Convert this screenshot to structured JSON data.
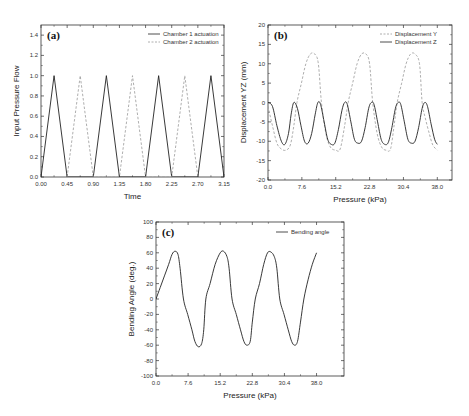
{
  "chart_data": [
    {
      "id": "a",
      "type": "line",
      "panel_label": "(a)",
      "title": "",
      "xlabel": "Time",
      "ylabel": "Input Pressure Flow",
      "xlim": [
        0,
        3.15
      ],
      "ylim": [
        0,
        1.5
      ],
      "xticks": [
        "0.00",
        "0.45",
        "0.90",
        "1.35",
        "1.80",
        "2.25",
        "2.70",
        "3.15"
      ],
      "yticks": [
        "0.0",
        "0.2",
        "0.4",
        "0.6",
        "0.8",
        "1.0",
        "1.2",
        "1.4"
      ],
      "grid": false,
      "legend_position": "top-right",
      "series": [
        {
          "name": "Chamber 1 actuation",
          "style": "solid",
          "x": [
            0.0,
            0.225,
            0.45,
            0.9,
            1.125,
            1.35,
            1.8,
            2.025,
            2.25,
            2.7,
            2.925,
            3.15
          ],
          "y": [
            0.0,
            1.0,
            0.0,
            0.0,
            1.0,
            0.0,
            0.0,
            1.0,
            0.0,
            0.0,
            1.0,
            0.0
          ]
        },
        {
          "name": "Chamber 2 actuation",
          "style": "dashed",
          "x": [
            0.45,
            0.675,
            0.9,
            1.35,
            1.575,
            1.8,
            2.25,
            2.475,
            2.7
          ],
          "y": [
            0.0,
            1.0,
            0.0,
            0.0,
            1.0,
            0.0,
            0.0,
            1.0,
            0.0
          ]
        }
      ]
    },
    {
      "id": "b",
      "type": "line",
      "panel_label": "(b)",
      "title": "",
      "xlabel": "Pressure (kPa)",
      "ylabel": "Displacement YZ (mm)",
      "xlim": [
        0,
        41.3
      ],
      "ylim": [
        -20,
        20
      ],
      "xticks": [
        "0.0",
        "7.6",
        "15.2",
        "22.8",
        "30.4",
        "38.0"
      ],
      "xtick_values": [
        0,
        7.6,
        15.2,
        22.8,
        30.4,
        38.0
      ],
      "yticks": [
        "-20",
        "-15",
        "-10",
        "-5",
        "0",
        "5",
        "10",
        "15",
        "20"
      ],
      "grid": false,
      "legend_position": "top-right",
      "series": [
        {
          "name": "Displacement Y",
          "style": "dashed",
          "x": [
            0,
            1,
            2,
            3,
            4,
            5,
            5.8,
            6.5,
            7.5,
            8.5,
            9.5,
            10.5,
            11.3,
            12,
            13,
            14,
            15.2,
            16.2,
            17.2,
            18,
            19,
            20,
            21,
            22,
            22.8,
            23.5,
            24.5,
            25.5,
            26.5,
            27.5,
            28.3,
            29,
            30,
            31,
            32,
            33,
            34,
            34.6,
            35.3,
            36.2,
            37,
            38
          ],
          "y": [
            -1,
            -6,
            -10.5,
            -12,
            -12.3,
            -11,
            -6,
            0,
            5,
            10,
            12.5,
            12.5,
            10,
            0,
            -8,
            -11.5,
            -12.3,
            -12,
            -6,
            0,
            5,
            10,
            12.5,
            12.5,
            10,
            0,
            -8,
            -11.5,
            -12.3,
            -12,
            -6,
            0,
            5,
            10,
            12.5,
            12.5,
            10,
            0,
            -4,
            -8,
            -11,
            -12.3
          ]
        },
        {
          "name": "Displacement Z",
          "style": "solid",
          "x": [
            0,
            1,
            2,
            3,
            3.8,
            4.6,
            5.2,
            5.8,
            6.6,
            7.4,
            8.2,
            9,
            9.8,
            10.6,
            11.2,
            11.8,
            12.6,
            13.4,
            14.2,
            15,
            15.8,
            16.6,
            17.2,
            17.8,
            18.6,
            19.4,
            20.2,
            21,
            21.8,
            22.6,
            23.2,
            23.8,
            24.6,
            25.4,
            26.2,
            27,
            27.8,
            28.6,
            29.2,
            29.8,
            30.6,
            31.4,
            32.2,
            33,
            33.8,
            34.6,
            35.2,
            35.8,
            36.6,
            37.4,
            38
          ],
          "y": [
            0,
            -1,
            -6,
            -10,
            -10.8,
            -8,
            -3,
            0,
            -1.5,
            -6,
            -10,
            -10.5,
            -8,
            -3,
            0,
            -0.5,
            -5,
            -9.5,
            -10.8,
            -10.5,
            -7,
            -2,
            0,
            -0.5,
            -5,
            -9.5,
            -10.5,
            -10,
            -6.5,
            -1.5,
            0,
            -0.5,
            -5,
            -9.5,
            -10.8,
            -10.3,
            -6.5,
            -1.5,
            0,
            -0.5,
            -5,
            -9.5,
            -10.5,
            -10,
            -6.5,
            -1.5,
            0,
            -1,
            -5.5,
            -9.5,
            -10.8
          ]
        }
      ]
    },
    {
      "id": "c",
      "type": "line",
      "panel_label": "(c)",
      "title": "",
      "xlabel": "Pressure (kPa)",
      "ylabel": "Bending Angle (deg.)",
      "xlim": [
        0,
        44.5
      ],
      "ylim": [
        -100,
        100
      ],
      "xticks": [
        "0.0",
        "7.6",
        "15.2",
        "22.8",
        "30.4",
        "38.0"
      ],
      "xtick_values": [
        0,
        7.6,
        15.2,
        22.8,
        30.4,
        38.0
      ],
      "yticks": [
        "-100",
        "-80",
        "-60",
        "-40",
        "-20",
        "0",
        "20",
        "40",
        "60",
        "80",
        "100"
      ],
      "grid": false,
      "legend_position": "top-right",
      "series": [
        {
          "name": "Bending angle",
          "style": "solid",
          "x": [
            0,
            1,
            2,
            3,
            3.8,
            4.5,
            5.2,
            5.7,
            6.5,
            7.5,
            8.5,
            9.2,
            10,
            10.8,
            11.3,
            11.8,
            12.8,
            14,
            15.2,
            16,
            16.8,
            17.3,
            18,
            19,
            20,
            20.8,
            21.5,
            22.3,
            22.8,
            23.5,
            24.5,
            25.5,
            26.4,
            27.2,
            28,
            28.6,
            29.3,
            30.3,
            31.3,
            32.1,
            32.8,
            33.5,
            34.2,
            35,
            36,
            37,
            38
          ],
          "y": [
            0,
            15,
            30,
            45,
            58,
            62,
            58,
            40,
            0,
            -20,
            -40,
            -55,
            -62,
            -58,
            -40,
            0,
            20,
            45,
            60,
            62,
            55,
            40,
            0,
            -20,
            -40,
            -55,
            -60,
            -55,
            -30,
            0,
            20,
            45,
            60,
            61,
            55,
            40,
            0,
            -20,
            -40,
            -55,
            -60,
            -55,
            -30,
            0,
            25,
            45,
            60
          ]
        }
      ]
    }
  ]
}
